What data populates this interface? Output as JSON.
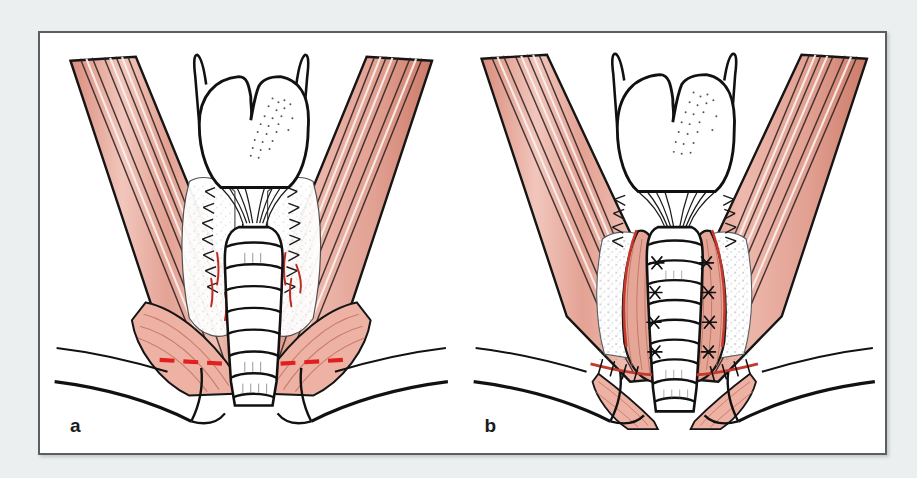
{
  "figure": {
    "domain": "anatomical-surgical-illustration",
    "background_color": "#ecefef",
    "plate_color": "#ffffff",
    "frame_border_color": "#5a5f63",
    "ink_color": "#111111",
    "muscle_fill": "#e4a294",
    "muscle_fill_light": "#f0c4ba",
    "muscle_shadow": "#c87c6c",
    "incision_marker_color": "#e02020",
    "stipple_color": "#6d7478",
    "panels": [
      {
        "id": "a",
        "label": "a",
        "caption_text": "a",
        "stage": "planned division of the strap muscles",
        "markers": [
          {
            "name": "incision-line-left",
            "style": "red dashed",
            "color": "#e02020"
          },
          {
            "name": "incision-line-right",
            "style": "red dashed",
            "color": "#e02020"
          }
        ],
        "structures": [
          "thyroid-cartilage",
          "superior-horn-left",
          "superior-horn-right",
          "cricothyroid-membrane",
          "trachea",
          "tracheal-rings",
          "thyroid-gland-bed-left",
          "thyroid-gland-bed-right",
          "suture-line-left",
          "suture-line-right",
          "sternocleidomastoid-left",
          "sternocleidomastoid-right",
          "strap-muscle-left",
          "strap-muscle-right",
          "clavicle-left",
          "clavicle-right",
          "sternal-notch"
        ]
      },
      {
        "id": "b",
        "label": "b",
        "caption_text": "b",
        "stage": "completed repair with the muscle flaps sutured in the midline",
        "markers": [
          {
            "name": "suture-knot-row-midline",
            "style": "dark star knots",
            "color": "#111111"
          },
          {
            "name": "suture-line-transverse",
            "style": "running stitch",
            "color": "#111111"
          }
        ],
        "structures": [
          "thyroid-cartilage",
          "superior-horn-left",
          "superior-horn-right",
          "cricothyroid-membrane",
          "trachea",
          "tracheal-rings",
          "thyroid-gland-bed-left",
          "thyroid-gland-bed-right",
          "muscle-flap-left",
          "muscle-flap-right",
          "midline-suture-column",
          "sternocleidomastoid-left",
          "sternocleidomastoid-right",
          "clavicle-left",
          "clavicle-right",
          "sternal-notch"
        ]
      }
    ]
  }
}
